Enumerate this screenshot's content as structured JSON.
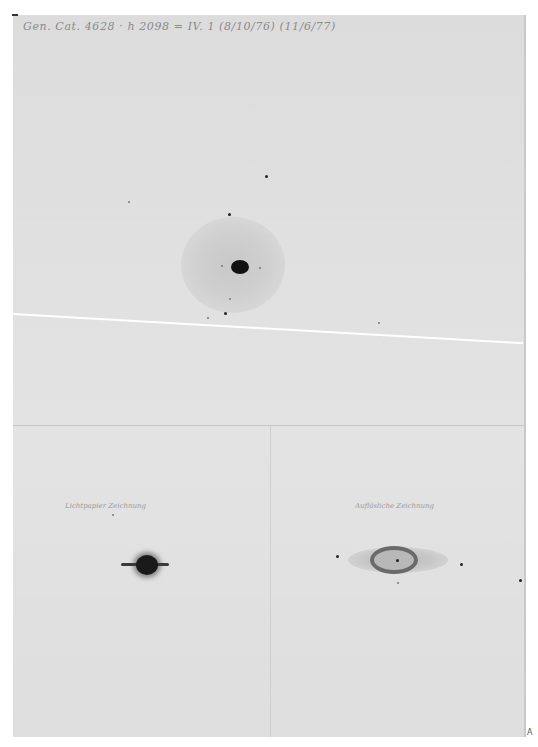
{
  "document": {
    "type": "astronomical drawing plate (comet / nebula sketches)",
    "header_note": "Gen. Cat. 4628 · h 2098 = IV. 1 (8/10/76) (11/6/77)",
    "figures": [
      {
        "id": "main",
        "description": "Nebula with dark central nucleus and diffuse halo"
      },
      {
        "id": "left",
        "label": "Lichtpapier Zeichnung",
        "description": "Dark disk with horizontal bar"
      },
      {
        "id": "right",
        "label": "Auflösliche Zeichnung",
        "description": "Elliptical ring nebula with central star"
      }
    ],
    "corner_mark": "A"
  },
  "colors": {
    "paper": "#e0e0e0",
    "ink": "#111111",
    "halo": "#c8c8c8",
    "ring": "#6a6a6a",
    "crack": "#ffffff"
  }
}
